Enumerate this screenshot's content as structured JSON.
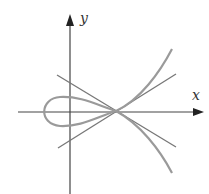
{
  "diagram": {
    "type": "parametric-curve-with-tangents",
    "axis_labels": {
      "x": "x",
      "y": "y"
    },
    "colors": {
      "axis": "#444444",
      "curve": "#9a9a9a",
      "tangent": "#777777",
      "background": "#ffffff"
    },
    "elements": [
      "x-axis with arrow",
      "y-axis with arrow",
      "looping curve crossing itself on positive x-axis",
      "two tangent lines at self-intersection point"
    ]
  }
}
